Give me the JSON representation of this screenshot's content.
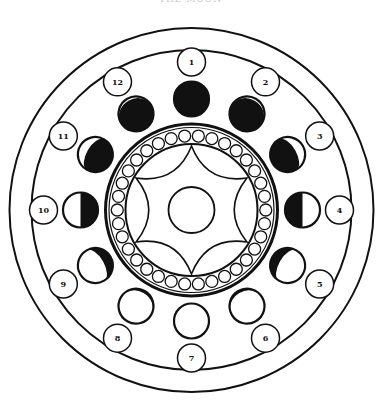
{
  "title": "THE MOON",
  "colors": {
    "ink": "#111111",
    "paper": "#ffffff"
  },
  "diagram": {
    "center": [
      191.5,
      210
    ],
    "outer_rings": [
      182,
      160
    ],
    "bead_ring": {
      "outer_r": 86,
      "inner_r": 66,
      "bead_r": 6,
      "bead_count": 34
    },
    "star": {
      "points": 6,
      "outer_r": 64,
      "inner_r": 30
    },
    "center_circle_r": 23,
    "moon_orbit_r": 111,
    "moon_r": 17.5,
    "label_orbit_r": 148,
    "label_r": 14
  },
  "phases": [
    {
      "label": "1",
      "step": 0
    },
    {
      "label": "2",
      "step": 1
    },
    {
      "label": "3",
      "step": 2
    },
    {
      "label": "4",
      "step": 3
    },
    {
      "label": "5",
      "step": 4
    },
    {
      "label": "6",
      "step": 5
    },
    {
      "label": "7",
      "step": 6
    },
    {
      "label": "8",
      "step": 5
    },
    {
      "label": "9",
      "step": 4
    },
    {
      "label": "10",
      "step": 3
    },
    {
      "label": "11",
      "step": 2
    },
    {
      "label": "12",
      "step": 1
    }
  ]
}
